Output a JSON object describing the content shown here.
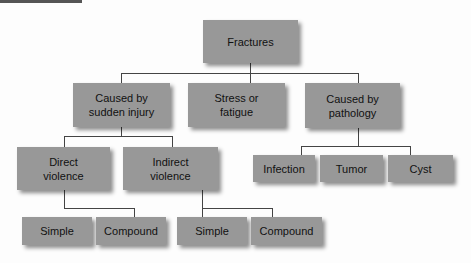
{
  "diagram": {
    "root": "Fractures",
    "level1": [
      {
        "label": "Caused by\nsudden injury"
      },
      {
        "label": "Stress or\nfatigue"
      },
      {
        "label": "Caused by\npathology"
      }
    ],
    "injury_children": [
      {
        "label": "Direct\nviolence"
      },
      {
        "label": "Indirect\nviolence"
      }
    ],
    "pathology_children": [
      {
        "label": "Infection"
      },
      {
        "label": "Tumor"
      },
      {
        "label": "Cyst"
      }
    ],
    "direct_children": [
      {
        "label": "Simple"
      },
      {
        "label": "Compound"
      }
    ],
    "indirect_children": [
      {
        "label": "Simple"
      },
      {
        "label": "Compound"
      }
    ]
  },
  "colors": {
    "node_fill": "#989898",
    "line": "#444444",
    "background": "#fdfdfd"
  }
}
